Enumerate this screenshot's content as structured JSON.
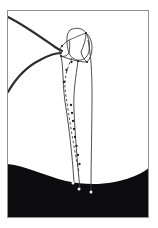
{
  "figure": {
    "domain_kind": "line-drawing",
    "caption": "",
    "title": "",
    "background_color": "#ffffff",
    "frame": {
      "label": "image-border",
      "stroke_color": "#8f8f8f",
      "fill_color": "#ffffff",
      "x": 7,
      "y": 10,
      "width": 142,
      "height": 208,
      "stroke_width": 1
    },
    "ink": {
      "outline_color": "#3a3a42",
      "thick_contour_color": "#2b2b30",
      "dark_mass_color": "#0d0d10",
      "marker_color": "#1c1c20",
      "terminal_dot_color": "#efefef"
    },
    "parts": [
      {
        "name": "proximal-bone-head",
        "description": "rounded proximal epiphysis outline at top",
        "label": ""
      },
      {
        "name": "bone-neck",
        "description": "narrow neck segment joining head to shaft",
        "label": ""
      },
      {
        "name": "greater-tubercle",
        "description": "lateral prominence right of neck",
        "label": ""
      },
      {
        "name": "bone-shaft-medial-cortex",
        "description": "long medial cortical line curving down",
        "label": ""
      },
      {
        "name": "bone-shaft-lateral-cortex",
        "description": "long lateral cortical line running down",
        "label": ""
      },
      {
        "name": "medullary-axis-line",
        "description": "beaded axis line down the marrow canal",
        "label": ""
      },
      {
        "name": "soft-tissue-contour-upper",
        "description": "thick straight contour from upper-left to bone",
        "label": ""
      },
      {
        "name": "soft-tissue-contour-lower",
        "description": "thick curved contour sweeping from left edge to bone",
        "label": ""
      },
      {
        "name": "dark-mass-region",
        "description": "solid dark region filling lower portion with concave upper border",
        "label": ""
      }
    ],
    "axis_markers": {
      "name": "beaded-measurement-points",
      "count": 11,
      "points": [
        {
          "x": 71.5,
          "y": 62.0
        },
        {
          "x": 66.5,
          "y": 70.0
        },
        {
          "x": 64.0,
          "y": 82.0
        },
        {
          "x": 71.0,
          "y": 105.0
        },
        {
          "x": 72.0,
          "y": 113.0
        },
        {
          "x": 73.0,
          "y": 121.0
        },
        {
          "x": 74.0,
          "y": 129.0
        },
        {
          "x": 75.0,
          "y": 137.0
        },
        {
          "x": 76.5,
          "y": 146.0
        },
        {
          "x": 78.0,
          "y": 155.0
        },
        {
          "x": 79.5,
          "y": 164.0
        }
      ]
    },
    "terminal_dots": {
      "name": "shaft-endpoint-dots",
      "count": 3,
      "points": [
        {
          "x": 73.0,
          "y": 183.0
        },
        {
          "x": 79.0,
          "y": 189.0
        },
        {
          "x": 91.0,
          "y": 192.0
        }
      ]
    }
  }
}
